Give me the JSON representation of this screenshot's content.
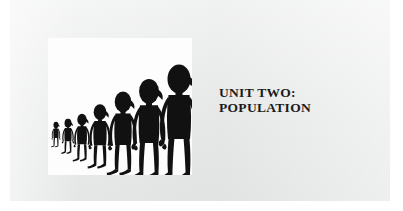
{
  "page": {
    "background_color": "#ffffff",
    "field_color": "#eceded"
  },
  "title": {
    "line1": "UNIT TWO:",
    "line2": "POPULATION",
    "color": "#1b1b1b"
  },
  "illustration": {
    "panel_background": "#fdfdfd",
    "figure_color": "#111111",
    "description": "Row of seven stylized black human silhouettes increasing in size from left to right",
    "figure_count": 7,
    "figures": [
      {
        "name": "figure-1",
        "x": 6,
        "scale": 0.22,
        "baseline": 108
      },
      {
        "name": "figure-2",
        "x": 18,
        "scale": 0.3,
        "baseline": 114
      },
      {
        "name": "figure-3",
        "x": 31,
        "scale": 0.41,
        "baseline": 120
      },
      {
        "name": "figure-4",
        "x": 47,
        "scale": 0.55,
        "baseline": 125
      },
      {
        "name": "figure-5",
        "x": 67,
        "scale": 0.72,
        "baseline": 131
      },
      {
        "name": "figure-6",
        "x": 91,
        "scale": 0.86,
        "baseline": 135
      },
      {
        "name": "figure-7",
        "x": 119,
        "scale": 1.0,
        "baseline": 137
      }
    ]
  }
}
